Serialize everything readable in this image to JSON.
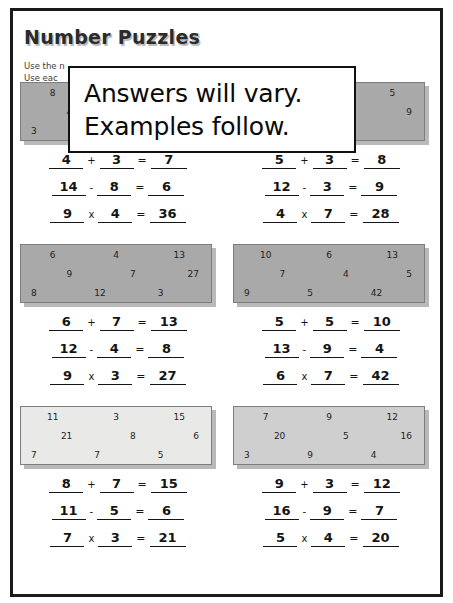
{
  "worksheet": {
    "title": "Number Puzzles",
    "instructions": [
      "Use the n",
      "Use eac"
    ]
  },
  "overlay_note": {
    "line1": "Answers will vary.",
    "line2": "Examples follow."
  },
  "puzzles": [
    {
      "id": "puzzle-1",
      "position": "row1-left",
      "shade": "dark",
      "grid": [
        [
          "8",
          "",
          ""
        ],
        [
          "4",
          "",
          ""
        ],
        [
          "3",
          "",
          ""
        ]
      ],
      "equations": [
        {
          "a": "4",
          "op": "+",
          "b": "3",
          "eq": "=",
          "result": "7"
        },
        {
          "a": "14",
          "op": "-",
          "b": "8",
          "eq": "=",
          "result": "6"
        },
        {
          "a": "9",
          "op": "x",
          "b": "4",
          "eq": "=",
          "result": "36"
        }
      ]
    },
    {
      "id": "puzzle-2",
      "position": "row1-right",
      "shade": "dark",
      "grid": [
        [
          "",
          "",
          "5"
        ],
        [
          "",
          "28",
          "9"
        ],
        [
          "",
          "12",
          ""
        ]
      ],
      "equations": [
        {
          "a": "5",
          "op": "+",
          "b": "3",
          "eq": "=",
          "result": "8"
        },
        {
          "a": "12",
          "op": "-",
          "b": "3",
          "eq": "=",
          "result": "9"
        },
        {
          "a": "4",
          "op": "x",
          "b": "7",
          "eq": "=",
          "result": "28"
        }
      ]
    },
    {
      "id": "puzzle-3",
      "position": "row2-left",
      "shade": "dark",
      "grid": [
        [
          "6",
          "4",
          "13"
        ],
        [
          "9",
          "7",
          "27"
        ],
        [
          "8",
          "12",
          "3"
        ]
      ],
      "equations": [
        {
          "a": "6",
          "op": "+",
          "b": "7",
          "eq": "=",
          "result": "13"
        },
        {
          "a": "12",
          "op": "-",
          "b": "4",
          "eq": "=",
          "result": "8"
        },
        {
          "a": "9",
          "op": "x",
          "b": "3",
          "eq": "=",
          "result": "27"
        }
      ]
    },
    {
      "id": "puzzle-4",
      "position": "row2-right",
      "shade": "dark",
      "grid": [
        [
          "10",
          "6",
          "13"
        ],
        [
          "7",
          "4",
          "5"
        ],
        [
          "9",
          "5",
          "42"
        ]
      ],
      "equations": [
        {
          "a": "5",
          "op": "+",
          "b": "5",
          "eq": "=",
          "result": "10"
        },
        {
          "a": "13",
          "op": "-",
          "b": "9",
          "eq": "=",
          "result": "4"
        },
        {
          "a": "6",
          "op": "x",
          "b": "7",
          "eq": "=",
          "result": "42"
        }
      ]
    },
    {
      "id": "puzzle-5",
      "position": "row3-left",
      "shade": "light",
      "grid": [
        [
          "11",
          "3",
          "15"
        ],
        [
          "21",
          "8",
          "6"
        ],
        [
          "7",
          "7",
          "5"
        ]
      ],
      "equations": [
        {
          "a": "8",
          "op": "+",
          "b": "7",
          "eq": "=",
          "result": "15"
        },
        {
          "a": "11",
          "op": "-",
          "b": "5",
          "eq": "=",
          "result": "6"
        },
        {
          "a": "7",
          "op": "x",
          "b": "3",
          "eq": "=",
          "result": "21"
        }
      ]
    },
    {
      "id": "puzzle-6",
      "position": "row3-right",
      "shade": "mid",
      "grid": [
        [
          "7",
          "9",
          "12"
        ],
        [
          "20",
          "5",
          "16"
        ],
        [
          "3",
          "9",
          "4"
        ]
      ],
      "equations": [
        {
          "a": "9",
          "op": "+",
          "b": "3",
          "eq": "=",
          "result": "12"
        },
        {
          "a": "16",
          "op": "-",
          "b": "9",
          "eq": "=",
          "result": "7"
        },
        {
          "a": "5",
          "op": "x",
          "b": "4",
          "eq": "=",
          "result": "20"
        }
      ]
    }
  ]
}
